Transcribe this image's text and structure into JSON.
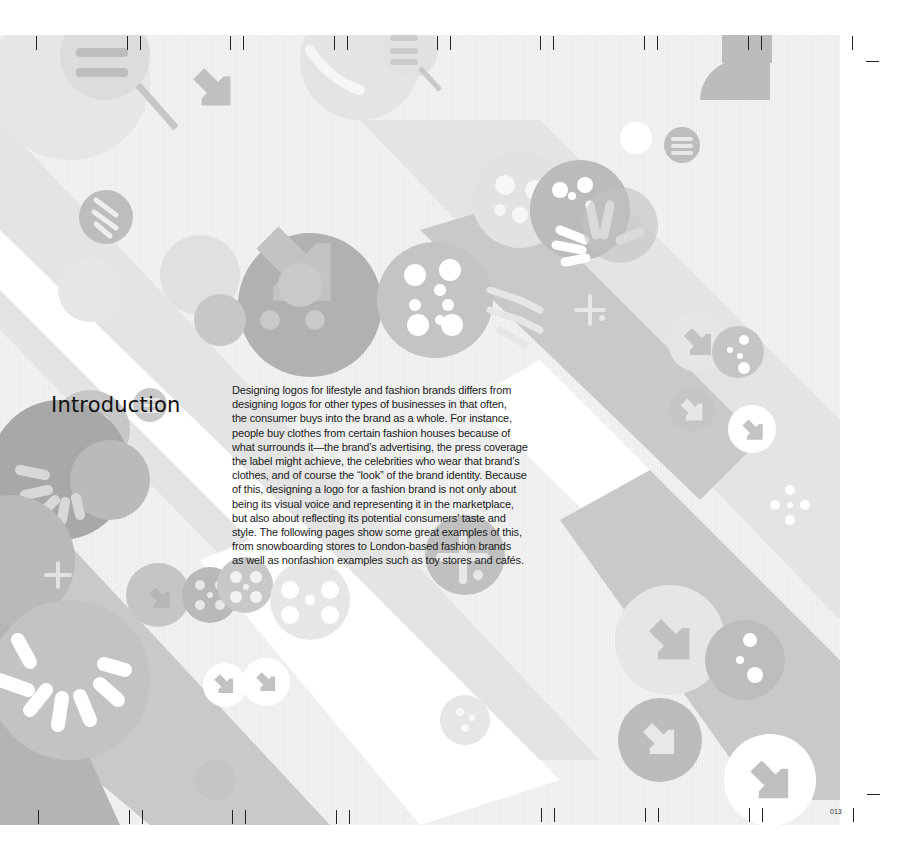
{
  "page": {
    "heading": "Introduction",
    "body_lines": [
      "Designing logos for lifestyle and fashion brands differs from",
      "designing logos for other types of businesses in that often,",
      "the consumer buys into the brand as a whole. For instance,",
      "people buy clothes from certain fashion houses because of",
      "what surrounds it—the brand’s advertising, the press coverage",
      "the label might achieve, the celebrities who wear that brand’s",
      "clothes, and of course the “look” of the brand identity. Because",
      "of this, designing a logo for a fashion brand is not only about",
      "being its visual voice and representing it in the marketplace,",
      "but also about reflecting its potential consumers’ taste and",
      "style. The following pages show some great examples of this,",
      "from snowboarding stores to London-based fashion brands",
      "as well as nonfashion examples such as toy stores and cafés."
    ],
    "page_number": "013"
  },
  "artwork": {
    "icons": [
      "arrow-down-right-icon",
      "plus-icon",
      "hamburger-lines-icon",
      "dotted-circle-icon",
      "sunburst-icon"
    ],
    "colors": {
      "page_bg": "#f1f1f1",
      "light_grey": "#e2e2e2",
      "mid_grey": "#c8c8c8",
      "dark_grey": "#b2b2b2",
      "darkest_grey": "#a3a3a3",
      "white": "#ffffff",
      "text": "#1b1b1b"
    }
  }
}
